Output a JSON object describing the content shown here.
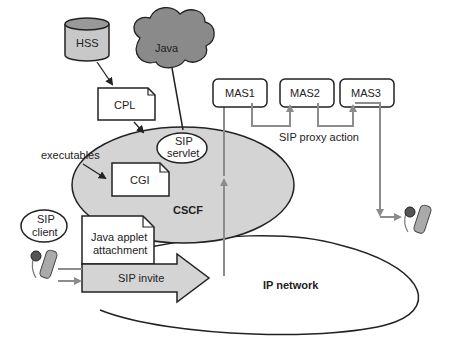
{
  "diagram": {
    "hss": "HSS",
    "java": "Java",
    "cpl": "CPL",
    "sip_servlet_line1": "SIP",
    "sip_servlet_line2": "servlet",
    "executables": "executables",
    "cgi": "CGI",
    "cscf": "CSCF",
    "sip_client_line1": "SIP",
    "sip_client_line2": "client",
    "java_applet_line1": "Java applet",
    "java_applet_line2": "attachment",
    "sip_invite": "SIP invite",
    "ip_network": "IP network",
    "mas1": "MAS1",
    "mas2": "MAS2",
    "mas3": "MAS3",
    "sip_proxy_action": "SIP proxy action"
  },
  "colors": {
    "light_gray": "#d4d4d4",
    "cloud_gray": "#8a8a8a",
    "arrow_gray": "#8c8c8c",
    "outline": "#222222"
  }
}
